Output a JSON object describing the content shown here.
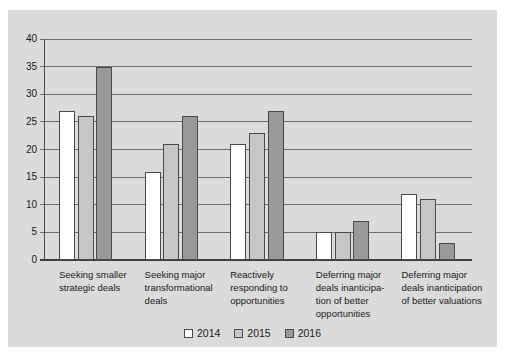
{
  "chart_data": {
    "type": "bar",
    "title": "",
    "xlabel": "",
    "ylabel": "",
    "ylim": [
      0,
      40
    ],
    "ytick_step": 5,
    "yticks": [
      0,
      5,
      10,
      15,
      20,
      25,
      30,
      35,
      40
    ],
    "grid": "horizontal",
    "legend_position": "bottom",
    "categories": [
      {
        "lines": [
          "Seeking smaller",
          "strategic deals"
        ]
      },
      {
        "lines": [
          "Seeking major",
          "transformational",
          "deals"
        ]
      },
      {
        "lines": [
          "Reactively",
          "responding to",
          "opportunities"
        ]
      },
      {
        "lines": [
          "Deferring major",
          "deals inanticipa-",
          "tion of better",
          "opportunities"
        ]
      },
      {
        "lines": [
          "Deferring major",
          "deals inanticipation",
          "of better valuations"
        ]
      }
    ],
    "series": [
      {
        "name": "2014",
        "color": "#ffffff",
        "values": [
          27,
          16,
          21,
          5,
          12
        ]
      },
      {
        "name": "2015",
        "color": "#c6c6c6",
        "values": [
          26,
          21,
          23,
          5,
          11
        ]
      },
      {
        "name": "2016",
        "color": "#999999",
        "values": [
          35,
          26,
          27,
          7,
          3
        ]
      }
    ],
    "colors": {
      "page_background": "#ffffff",
      "plot_background": "#dbdbdb",
      "gridline": "#6e6e6e",
      "axis": "#4a4a4a",
      "bar_border": "#4a4a4a",
      "text": "#1a1a1a"
    }
  }
}
